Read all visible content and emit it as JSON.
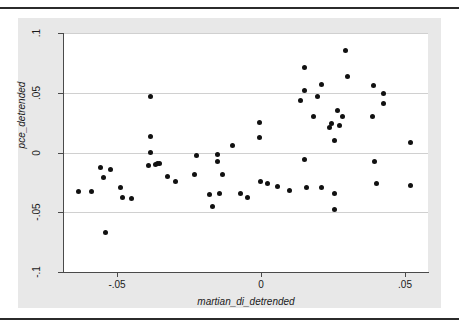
{
  "figure": {
    "background_color": "#e8e8e8",
    "plot_background_color": "#ffffff",
    "marker_color": "#111111",
    "grid_color": "#d0d0d0",
    "axis_color": "#4a4a4a"
  },
  "chart_data": {
    "type": "scatter",
    "title": "",
    "xlabel": "martian_di_detrended",
    "ylabel": "pce_detrended",
    "xlim": [
      -0.0685,
      0.058
    ],
    "ylim": [
      -0.1,
      0.1
    ],
    "xticks": [
      -0.05,
      0,
      0.05
    ],
    "xticklabels": [
      "-.05",
      "0",
      ".05"
    ],
    "yticks": [
      -0.1,
      -0.05,
      0,
      0.05,
      0.1
    ],
    "yticklabels": [
      "-.1",
      "-.05",
      "0",
      ".05",
      ".1"
    ],
    "grid": "horizontal",
    "legend": "none",
    "series": [
      {
        "name": "pce_detrended vs martian_di_detrended",
        "points": [
          [
            -0.0634,
            -0.0328
          ],
          [
            -0.0591,
            -0.033
          ],
          [
            -0.0558,
            -0.0126
          ],
          [
            -0.0547,
            -0.0212
          ],
          [
            -0.054,
            -0.0672
          ],
          [
            -0.0522,
            -0.0145
          ],
          [
            -0.0489,
            -0.0296
          ],
          [
            -0.0482,
            -0.0372
          ],
          [
            -0.0449,
            -0.0386
          ],
          [
            -0.0384,
            0.0471
          ],
          [
            -0.0384,
            0.0135
          ],
          [
            -0.0384,
            0.0
          ],
          [
            -0.0391,
            -0.0112
          ],
          [
            -0.0366,
            -0.0098
          ],
          [
            -0.0359,
            -0.0092
          ],
          [
            -0.0355,
            -0.0094
          ],
          [
            -0.0326,
            -0.0198
          ],
          [
            -0.0297,
            -0.024
          ],
          [
            -0.0225,
            -0.0028
          ],
          [
            -0.0232,
            -0.0184
          ],
          [
            -0.0181,
            -0.0348
          ],
          [
            -0.017,
            -0.045
          ],
          [
            -0.0152,
            -0.0016
          ],
          [
            -0.0152,
            -0.0072
          ],
          [
            -0.0145,
            -0.0346
          ],
          [
            -0.0134,
            -0.0184
          ],
          [
            -0.0098,
            0.0061
          ],
          [
            -0.0072,
            -0.034
          ],
          [
            -0.0047,
            -0.0372
          ],
          [
            -0.0007,
            0.0249
          ],
          [
            -0.0007,
            0.013
          ],
          [
            -0.0004,
            -0.0245
          ],
          [
            0.0022,
            -0.0258
          ],
          [
            0.0058,
            -0.0284
          ],
          [
            0.0098,
            -0.0318
          ],
          [
            0.0138,
            0.0432
          ],
          [
            0.0149,
            0.0715
          ],
          [
            0.0152,
            0.0518
          ],
          [
            0.0152,
            -0.006
          ],
          [
            0.0156,
            -0.0296
          ],
          [
            0.0181,
            0.0302
          ],
          [
            0.0196,
            0.0465
          ],
          [
            0.021,
            0.0572
          ],
          [
            0.021,
            -0.029
          ],
          [
            0.0236,
            0.0212
          ],
          [
            0.0243,
            0.0244
          ],
          [
            0.0254,
            0.0102
          ],
          [
            0.0254,
            -0.034
          ],
          [
            0.0254,
            -0.0478
          ],
          [
            0.0265,
            0.035
          ],
          [
            0.0272,
            0.0226
          ],
          [
            0.0283,
            0.0302
          ],
          [
            0.0294,
            0.0856
          ],
          [
            0.0301,
            0.0636
          ],
          [
            0.0388,
            0.0302
          ],
          [
            0.0391,
            0.0562
          ],
          [
            0.0395,
            -0.0072
          ],
          [
            0.0402,
            -0.0258
          ],
          [
            0.0424,
            0.0498
          ],
          [
            0.0424,
            0.041
          ],
          [
            0.0518,
            0.0082
          ],
          [
            0.0518,
            -0.0278
          ]
        ]
      }
    ]
  }
}
